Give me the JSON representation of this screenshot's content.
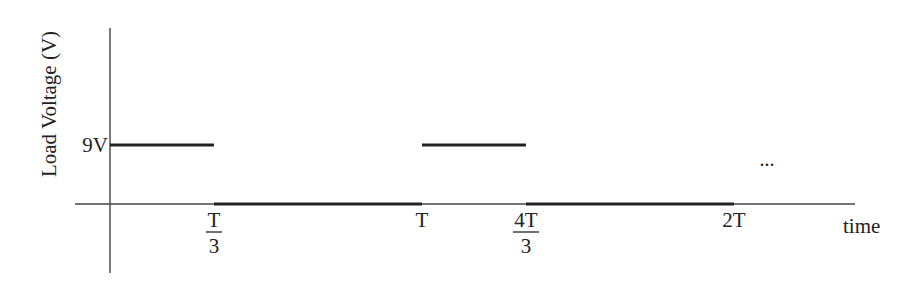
{
  "chart_data": {
    "type": "line",
    "subtype": "step",
    "title": "",
    "xlabel": "time",
    "ylabel": "Load Voltage (V)",
    "x_unit": "T",
    "xlim": [
      0,
      2.3
    ],
    "ylim": [
      -0.75,
      2.0
    ],
    "y_ticks": [
      {
        "value": 9,
        "label": "9V"
      }
    ],
    "x_ticks": [
      {
        "value": 0.3333,
        "label": "T/3",
        "numerator": "T",
        "denominator": "3",
        "fraction": true
      },
      {
        "value": 1.0,
        "label": "T",
        "numerator": "T",
        "denominator": "",
        "fraction": false
      },
      {
        "value": 1.3333,
        "label": "4T/3",
        "numerator": "4T",
        "denominator": "3",
        "fraction": true
      },
      {
        "value": 2.0,
        "label": "2T",
        "numerator": "2T",
        "denominator": "",
        "fraction": false
      }
    ],
    "series": [
      {
        "name": "Load Voltage",
        "unit": "V",
        "segments": [
          {
            "t_start": 0.0,
            "t_end": 0.3333,
            "voltage": 9
          },
          {
            "t_start": 0.3333,
            "t_end": 1.0,
            "voltage": 0
          },
          {
            "t_start": 1.0,
            "t_end": 1.3333,
            "voltage": 9
          },
          {
            "t_start": 1.3333,
            "t_end": 2.0,
            "voltage": 0
          }
        ]
      }
    ],
    "annotations": [
      {
        "text": "...",
        "meaning": "pattern continues"
      }
    ],
    "grid": false,
    "legend": "none"
  },
  "colors": {
    "axis": "#444444",
    "signal": "#222222",
    "text": "#222222"
  }
}
